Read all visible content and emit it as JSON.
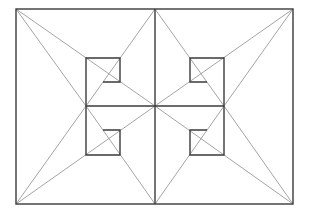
{
  "diagram": {
    "title": "",
    "canvas": {
      "width": 311,
      "height": 215,
      "background": "#ffffff"
    },
    "colors": {
      "frame": "#3a3a3a",
      "diagonal": "#9a9a9a"
    },
    "outer_rect": {
      "x1": 16,
      "y1": 9,
      "x2": 293,
      "y2": 204
    },
    "center": {
      "x": 155,
      "y": 106
    },
    "axes": [
      {
        "name": "vertical-divider",
        "x1": 155,
        "y1": 9,
        "x2": 155,
        "y2": 204
      },
      {
        "name": "horizontal-divider",
        "x1": 86,
        "y1": 106,
        "x2": 224,
        "y2": 106
      }
    ],
    "spiral_squares": [
      {
        "name": "top-left",
        "points": "86,106 86,58 120,58 120,82 103,82"
      },
      {
        "name": "bottom-left",
        "points": "86,106 86,155 120,155 120,130 103,130"
      },
      {
        "name": "top-right",
        "points": "224,106 224,58 190,58 190,82 207,82"
      },
      {
        "name": "bottom-right",
        "points": "224,106 224,155 190,155 190,130 207,130"
      }
    ],
    "diagonals": [
      {
        "name": "tl-to-left-node",
        "x1": 16,
        "y1": 9,
        "x2": 86,
        "y2": 106
      },
      {
        "name": "tl-to-center",
        "x1": 16,
        "y1": 9,
        "x2": 155,
        "y2": 106
      },
      {
        "name": "topmid-to-left-node",
        "x1": 155,
        "y1": 9,
        "x2": 86,
        "y2": 106
      },
      {
        "name": "bl-to-left-node",
        "x1": 16,
        "y1": 204,
        "x2": 86,
        "y2": 106
      },
      {
        "name": "bl-to-center",
        "x1": 16,
        "y1": 204,
        "x2": 155,
        "y2": 106
      },
      {
        "name": "bottommid-to-left-node",
        "x1": 155,
        "y1": 204,
        "x2": 86,
        "y2": 106
      },
      {
        "name": "tr-to-right-node",
        "x1": 293,
        "y1": 9,
        "x2": 224,
        "y2": 106
      },
      {
        "name": "tr-to-center",
        "x1": 293,
        "y1": 9,
        "x2": 155,
        "y2": 106
      },
      {
        "name": "topmid-to-right-node",
        "x1": 155,
        "y1": 9,
        "x2": 224,
        "y2": 106
      },
      {
        "name": "br-to-right-node",
        "x1": 293,
        "y1": 204,
        "x2": 224,
        "y2": 106
      },
      {
        "name": "br-to-center",
        "x1": 293,
        "y1": 204,
        "x2": 155,
        "y2": 106
      },
      {
        "name": "bottommid-to-right-node",
        "x1": 155,
        "y1": 204,
        "x2": 224,
        "y2": 106
      }
    ]
  }
}
